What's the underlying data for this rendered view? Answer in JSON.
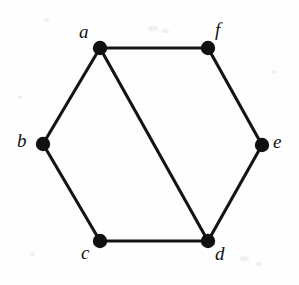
{
  "figure": {
    "type": "undirected-graph",
    "width": 299,
    "height": 285,
    "background_color": "#fefefe",
    "ink_color": "#111111",
    "vertex_radius": 7.2,
    "edge_width": 3.1
  },
  "vertices": [
    {
      "id": "a",
      "label": "a",
      "x": 100,
      "y": 48,
      "label_x": 79,
      "label_y": 22,
      "label_anchor": "upper-left"
    },
    {
      "id": "b",
      "label": "b",
      "x": 43,
      "y": 144,
      "label_x": 17,
      "label_y": 131,
      "label_anchor": "left"
    },
    {
      "id": "c",
      "label": "c",
      "x": 100,
      "y": 241,
      "label_x": 81,
      "label_y": 243,
      "label_anchor": "lower-left"
    },
    {
      "id": "d",
      "label": "d",
      "x": 208,
      "y": 241,
      "label_x": 215,
      "label_y": 244,
      "label_anchor": "lower-right"
    },
    {
      "id": "e",
      "label": "e",
      "x": 262,
      "y": 145,
      "label_x": 273,
      "label_y": 132,
      "label_anchor": "right"
    },
    {
      "id": "f",
      "label": "f",
      "x": 208,
      "y": 48,
      "label_x": 215,
      "label_y": 20,
      "label_anchor": "upper-right"
    }
  ],
  "edges": [
    {
      "id": "edge-a-f",
      "from": "a",
      "to": "f",
      "x1": 100,
      "y1": 48,
      "x2": 208,
      "y2": 48
    },
    {
      "id": "edge-a-b",
      "from": "a",
      "to": "b",
      "x1": 100,
      "y1": 48,
      "x2": 43,
      "y2": 144
    },
    {
      "id": "edge-a-d",
      "from": "a",
      "to": "d",
      "x1": 100,
      "y1": 48,
      "x2": 208,
      "y2": 241
    },
    {
      "id": "edge-b-c",
      "from": "b",
      "to": "c",
      "x1": 43,
      "y1": 144,
      "x2": 100,
      "y2": 241
    },
    {
      "id": "edge-c-d",
      "from": "c",
      "to": "d",
      "x1": 100,
      "y1": 241,
      "x2": 208,
      "y2": 241
    },
    {
      "id": "edge-d-e",
      "from": "d",
      "to": "e",
      "x1": 208,
      "y1": 241,
      "x2": 262,
      "y2": 145
    },
    {
      "id": "edge-e-f",
      "from": "e",
      "to": "f",
      "x1": 262,
      "y1": 145,
      "x2": 208,
      "y2": 48
    }
  ],
  "specks": [
    {
      "x": 148,
      "y": 26,
      "w": 10,
      "h": 5
    },
    {
      "x": 162,
      "y": 29,
      "w": 7,
      "h": 4
    },
    {
      "x": 44,
      "y": 18,
      "w": 5,
      "h": 4
    },
    {
      "x": 240,
      "y": 256,
      "w": 9,
      "h": 5
    },
    {
      "x": 256,
      "y": 262,
      "w": 6,
      "h": 4
    },
    {
      "x": 30,
      "y": 252,
      "w": 5,
      "h": 4
    },
    {
      "x": 272,
      "y": 70,
      "w": 4,
      "h": 4
    },
    {
      "x": 18,
      "y": 96,
      "w": 4,
      "h": 3
    }
  ]
}
